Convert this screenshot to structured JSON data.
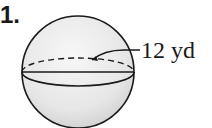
{
  "problem": {
    "number": "1."
  },
  "figure": {
    "shape": "sphere",
    "dimension_label": "12 yd",
    "dimension_type": "radius",
    "colors": {
      "stroke": "#1a1a1a",
      "fill_light": "#f2f2f2",
      "fill_dark": "#d4d4d4"
    }
  }
}
